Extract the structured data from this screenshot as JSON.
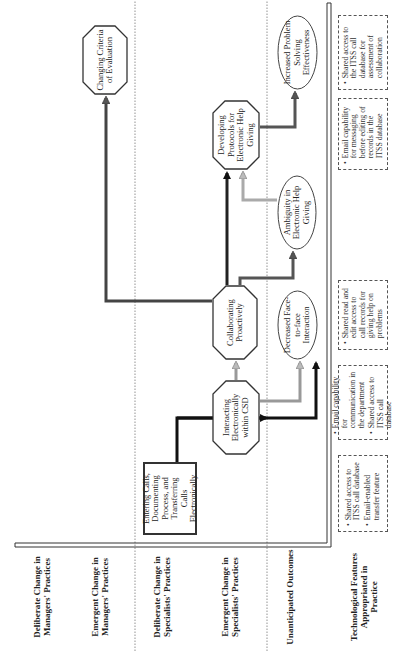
{
  "rows": [
    {
      "id": "deliberate-managers",
      "label": "Deliberate Change in Managers' Practices"
    },
    {
      "id": "emergent-managers",
      "label": "Emergent Change in Managers' Practices"
    },
    {
      "id": "deliberate-specialists",
      "label": "Deliberate Change in Specialists' Practices"
    },
    {
      "id": "emergent-specialists",
      "label": "Emergent Change in Specialists' Practices"
    },
    {
      "id": "unanticipated",
      "label": "Unanticipated Outcomes"
    },
    {
      "id": "features",
      "label": "Technological Features Appropriated in Practice"
    }
  ],
  "nodes": {
    "entering_calls": "Entering Calls, Documenting Process, and Transferring Calls Electronically",
    "interacting": "Interacting Electronically within CSD",
    "collaborating": "Collaborating Proactively",
    "developing": "Developing Protocols for Electronic Help Giving",
    "changing_criteria": "Changing Criteria of Evaluation",
    "decreased": "Decreased Face-to-face Interaction",
    "ambiguity": "Ambiguity in Electronic Help Giving",
    "increased": "Increased Problem Solving Effectiveness"
  },
  "features": [
    {
      "items": [
        "Shared access to ITSS call database",
        "Email-enabled transfer feature"
      ]
    },
    {
      "items": [
        "Email capability for communication in the department",
        "Shared access to ITSS call database"
      ]
    },
    {
      "items": [
        "Shared read and edit access to call records for giving help on problems"
      ]
    },
    {
      "items": [
        "Email capability for messaging before editing of records in the ITSS database"
      ]
    },
    {
      "items": [
        "Shared access to the ITSS call database for assessment of collaboration"
      ]
    }
  ],
  "colors": {
    "dark_arrow": "#1a1a1a",
    "medium_arrow": "#555555",
    "light_arrow": "#9a9a9a",
    "line": "#333333"
  }
}
